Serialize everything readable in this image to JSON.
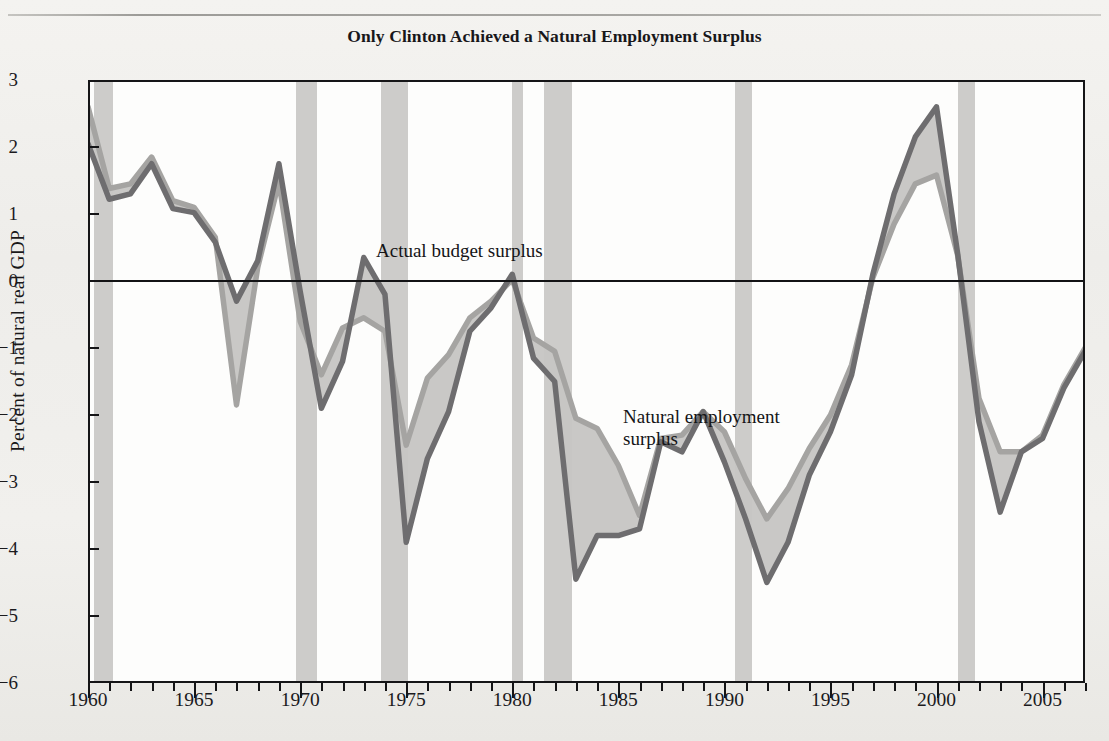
{
  "figure": {
    "title": "Only Clinton Achieved a Natural Employment Surplus",
    "background_color": "#f1f0ed",
    "plot_background_color": "#fdfdfc"
  },
  "annotations": [
    {
      "name": "actual-budget-surplus-label",
      "text": "Actual budget surplus"
    },
    {
      "name": "natural-employment-surplus-label",
      "text": "Natural employment\nsurplus"
    }
  ],
  "axes": {
    "y_title": "Percent of natural real GDP",
    "y_ticks": [
      3,
      2,
      1,
      0,
      -1,
      -2,
      -3,
      -4,
      -5,
      -6
    ],
    "y_tick_labels": [
      "3",
      "2",
      "1",
      "0",
      "−1",
      "−2",
      "−3",
      "−4",
      "−5",
      "−6"
    ],
    "x_tick_labels": [
      "1960",
      "1965",
      "1970",
      "1975",
      "1980",
      "1985",
      "1990",
      "1995",
      "2000",
      "2005"
    ],
    "x_ticks": [
      1960,
      1965,
      1970,
      1975,
      1980,
      1985,
      1990,
      1995,
      2000,
      2005
    ]
  },
  "colors": {
    "actual_line": "#6e6d6f",
    "natural_line": "#a5a4a2",
    "band_fill": "#c6c5c3",
    "recession_band": "#c9c8c6",
    "axis": "#141416",
    "zero_line": "#131315"
  },
  "chart_data": {
    "type": "line",
    "title": "Only Clinton Achieved a Natural Employment Surplus",
    "xlabel": "",
    "ylabel": "Percent of natural real GDP",
    "xlim": [
      1960,
      2007
    ],
    "ylim": [
      -6,
      3
    ],
    "grid": false,
    "legend": "inline-annotations",
    "zero_reference_line": 0,
    "x": [
      1960,
      1961,
      1962,
      1963,
      1964,
      1965,
      1966,
      1967,
      1968,
      1969,
      1970,
      1971,
      1972,
      1973,
      1974,
      1975,
      1976,
      1977,
      1978,
      1979,
      1980,
      1981,
      1982,
      1983,
      1984,
      1985,
      1986,
      1987,
      1988,
      1989,
      1990,
      1991,
      1992,
      1993,
      1994,
      1995,
      1996,
      1997,
      1998,
      1999,
      2000,
      2001,
      2002,
      2003,
      2004,
      2005,
      2006,
      2007
    ],
    "series": [
      {
        "name": "Actual budget surplus",
        "color": "#6e6d6f",
        "values": [
          2.05,
          1.22,
          1.3,
          1.75,
          1.08,
          1.02,
          0.58,
          -0.3,
          0.3,
          1.75,
          -0.15,
          -1.9,
          -1.2,
          0.35,
          -0.2,
          -3.9,
          -2.65,
          -1.95,
          -0.75,
          -0.4,
          0.1,
          -1.15,
          -1.5,
          -4.45,
          -3.8,
          -3.8,
          -3.7,
          -2.4,
          -2.55,
          -1.95,
          -2.7,
          -3.55,
          -4.5,
          -3.9,
          -2.9,
          -2.25,
          -1.4,
          0.1,
          1.3,
          2.15,
          2.6,
          0.4,
          -2.1,
          -3.45,
          -2.55,
          -2.35,
          -1.6,
          -1.05
        ]
      },
      {
        "name": "Natural employment surplus",
        "color": "#a5a4a2",
        "values": [
          2.6,
          1.38,
          1.45,
          1.85,
          1.2,
          1.1,
          0.65,
          -1.85,
          0.2,
          1.48,
          -0.6,
          -1.4,
          -0.7,
          -0.55,
          -0.75,
          -2.45,
          -1.45,
          -1.1,
          -0.55,
          -0.3,
          0.02,
          -0.85,
          -1.05,
          -2.05,
          -2.2,
          -2.75,
          -3.5,
          -2.35,
          -2.3,
          -1.95,
          -2.25,
          -2.95,
          -3.55,
          -3.1,
          -2.5,
          -2.0,
          -1.25,
          0.05,
          0.85,
          1.45,
          1.58,
          0.38,
          -1.75,
          -2.55,
          -2.55,
          -2.3,
          -1.55,
          -1.0
        ]
      }
    ],
    "recession_bands": [
      {
        "start": 1960.3,
        "end": 1961.2
      },
      {
        "start": 1969.8,
        "end": 1970.8
      },
      {
        "start": 1973.8,
        "end": 1975.1
      },
      {
        "start": 1980.0,
        "end": 1980.5
      },
      {
        "start": 1981.5,
        "end": 1982.8
      },
      {
        "start": 1990.5,
        "end": 1991.3
      },
      {
        "start": 2001.0,
        "end": 2001.8
      }
    ]
  }
}
